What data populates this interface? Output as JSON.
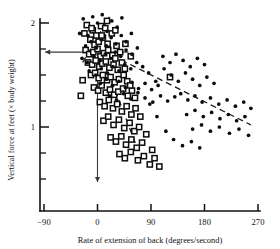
{
  "chart_data": {
    "type": "scatter",
    "title": "",
    "xlabel": "Rate of extension of back (degrees/second)",
    "ylabel": "Vertical force at feet (× body weight)",
    "xlim": [
      -90,
      270
    ],
    "ylim": [
      0.4,
      2.1
    ],
    "xticks": [
      -90,
      0,
      90,
      180,
      270
    ],
    "xtick_labels": [
      "−90",
      "0",
      "90",
      "180",
      "270"
    ],
    "yticks": [
      2,
      1
    ],
    "ytick_labels": [
      "2",
      "1"
    ],
    "yticks_minor": [
      1.75,
      1.5,
      1.25,
      0.75,
      0.5
    ],
    "grid": false,
    "legend": null,
    "annotations": [
      {
        "name": "horizontal-arrow-to-yaxis",
        "type": "arrow",
        "from": [
          52,
          1.72
        ],
        "to": [
          -88,
          1.72
        ],
        "note": "arrow pointing left to y-axis value"
      },
      {
        "name": "vertical-arrow-to-xaxis",
        "type": "arrow",
        "from": [
          0,
          1.62
        ],
        "to": [
          0,
          0.47
        ],
        "note": "arrow pointing down to x-axis at 0"
      }
    ],
    "trend_lines": [
      {
        "name": "upper-short-dashed",
        "style": "dashed",
        "from": [
          -25,
          1.62
        ],
        "to": [
          20,
          2.06
        ]
      },
      {
        "name": "long-shallow-dashed",
        "style": "dashed",
        "from": [
          10,
          1.73
        ],
        "to": [
          258,
          1.02
        ]
      },
      {
        "name": "steep-dashed",
        "style": "dashed",
        "from": [
          18,
          1.53
        ],
        "to": [
          68,
          0.78
        ]
      }
    ],
    "series": [
      {
        "name": "open-squares",
        "marker": "open-square",
        "color": "#0d0d0d",
        "points": [
          [
            -18,
            1.98
          ],
          [
            -8,
            1.93
          ],
          [
            -2,
            1.88
          ],
          [
            6,
            1.97
          ],
          [
            13,
            1.95
          ],
          [
            -12,
            1.84
          ],
          [
            -5,
            1.79
          ],
          [
            2,
            1.82
          ],
          [
            9,
            1.86
          ],
          [
            17,
            1.8
          ],
          [
            24,
            1.9
          ],
          [
            30,
            1.93
          ],
          [
            -20,
            1.74
          ],
          [
            -14,
            1.7
          ],
          [
            -7,
            1.72
          ],
          [
            0,
            1.75
          ],
          [
            5,
            1.68
          ],
          [
            11,
            1.71
          ],
          [
            18,
            1.74
          ],
          [
            25,
            1.69
          ],
          [
            32,
            1.78
          ],
          [
            38,
            1.72
          ],
          [
            -16,
            1.62
          ],
          [
            -9,
            1.6
          ],
          [
            -3,
            1.64
          ],
          [
            3,
            1.58
          ],
          [
            8,
            1.61
          ],
          [
            14,
            1.63
          ],
          [
            20,
            1.57
          ],
          [
            27,
            1.6
          ],
          [
            34,
            1.55
          ],
          [
            41,
            1.62
          ],
          [
            -11,
            1.5
          ],
          [
            -4,
            1.52
          ],
          [
            2,
            1.47
          ],
          [
            9,
            1.5
          ],
          [
            16,
            1.45
          ],
          [
            22,
            1.48
          ],
          [
            29,
            1.43
          ],
          [
            36,
            1.46
          ],
          [
            44,
            1.5
          ],
          [
            50,
            1.44
          ],
          [
            -6,
            1.38
          ],
          [
            1,
            1.35
          ],
          [
            7,
            1.4
          ],
          [
            14,
            1.33
          ],
          [
            21,
            1.36
          ],
          [
            28,
            1.31
          ],
          [
            35,
            1.34
          ],
          [
            43,
            1.37
          ],
          [
            51,
            1.3
          ],
          [
            58,
            1.35
          ],
          [
            4,
            1.24
          ],
          [
            12,
            1.2
          ],
          [
            19,
            1.26
          ],
          [
            26,
            1.18
          ],
          [
            33,
            1.22
          ],
          [
            41,
            1.15
          ],
          [
            49,
            1.2
          ],
          [
            57,
            1.12
          ],
          [
            64,
            1.18
          ],
          [
            10,
            1.06
          ],
          [
            18,
            1.1
          ],
          [
            27,
            1.02
          ],
          [
            36,
            1.07
          ],
          [
            45,
            0.99
          ],
          [
            54,
            1.04
          ],
          [
            62,
            0.96
          ],
          [
            70,
            1.0
          ],
          [
            22,
            0.9
          ],
          [
            31,
            0.86
          ],
          [
            40,
            0.91
          ],
          [
            48,
            0.83
          ],
          [
            57,
            0.88
          ],
          [
            66,
            0.8
          ],
          [
            75,
            0.85
          ],
          [
            37,
            0.74
          ],
          [
            46,
            0.7
          ],
          [
            56,
            0.76
          ],
          [
            68,
            0.68
          ],
          [
            78,
            0.72
          ],
          [
            88,
            0.64
          ],
          [
            96,
            0.7
          ],
          [
            30,
            1.66
          ],
          [
            46,
            1.56
          ],
          [
            55,
            1.4
          ],
          [
            63,
            1.28
          ],
          [
            72,
            1.1
          ],
          [
            82,
            0.93
          ],
          [
            92,
            0.78
          ],
          [
            104,
            0.62
          ],
          [
            -22,
            1.9
          ],
          [
            -25,
            1.45
          ],
          [
            -28,
            1.3
          ],
          [
            122,
            1.48
          ],
          [
            7,
            1.88
          ],
          [
            -10,
            1.95
          ],
          [
            47,
            1.8
          ],
          [
            56,
            1.68
          ],
          [
            16,
            2.02
          ]
        ]
      },
      {
        "name": "filled-dots",
        "marker": "filled-circle",
        "color": "#0d0d0d",
        "points": [
          [
            -30,
            1.9
          ],
          [
            -24,
            2.04
          ],
          [
            -16,
            1.88
          ],
          [
            -8,
            2.06
          ],
          [
            0,
            2.0
          ],
          [
            8,
            2.08
          ],
          [
            16,
            1.92
          ],
          [
            24,
            2.02
          ],
          [
            33,
            1.96
          ],
          [
            41,
            2.05
          ],
          [
            -20,
            1.78
          ],
          [
            -11,
            1.82
          ],
          [
            -2,
            1.76
          ],
          [
            7,
            1.84
          ],
          [
            15,
            1.78
          ],
          [
            23,
            1.86
          ],
          [
            31,
            1.8
          ],
          [
            40,
            1.88
          ],
          [
            48,
            1.82
          ],
          [
            57,
            1.9
          ],
          [
            -26,
            1.66
          ],
          [
            -17,
            1.62
          ],
          [
            -6,
            1.68
          ],
          [
            4,
            1.64
          ],
          [
            13,
            1.7
          ],
          [
            22,
            1.66
          ],
          [
            30,
            1.72
          ],
          [
            39,
            1.68
          ],
          [
            48,
            1.74
          ],
          [
            58,
            1.7
          ],
          [
            67,
            1.76
          ],
          [
            -14,
            1.54
          ],
          [
            -3,
            1.5
          ],
          [
            6,
            1.56
          ],
          [
            16,
            1.52
          ],
          [
            26,
            1.58
          ],
          [
            36,
            1.54
          ],
          [
            46,
            1.6
          ],
          [
            56,
            1.56
          ],
          [
            66,
            1.62
          ],
          [
            76,
            1.58
          ],
          [
            86,
            1.52
          ],
          [
            5,
            1.42
          ],
          [
            15,
            1.46
          ],
          [
            25,
            1.4
          ],
          [
            36,
            1.44
          ],
          [
            47,
            1.38
          ],
          [
            58,
            1.43
          ],
          [
            69,
            1.37
          ],
          [
            80,
            1.42
          ],
          [
            91,
            1.36
          ],
          [
            102,
            1.4
          ],
          [
            20,
            1.3
          ],
          [
            32,
            1.26
          ],
          [
            44,
            1.32
          ],
          [
            56,
            1.27
          ],
          [
            68,
            1.33
          ],
          [
            80,
            1.28
          ],
          [
            93,
            1.24
          ],
          [
            106,
            1.3
          ],
          [
            118,
            1.25
          ],
          [
            130,
            1.29
          ],
          [
            112,
            1.56
          ],
          [
            124,
            1.5
          ],
          [
            136,
            1.44
          ],
          [
            148,
            1.52
          ],
          [
            160,
            1.46
          ],
          [
            172,
            1.4
          ],
          [
            184,
            1.48
          ],
          [
            196,
            1.42
          ],
          [
            140,
            1.32
          ],
          [
            152,
            1.26
          ],
          [
            164,
            1.3
          ],
          [
            176,
            1.24
          ],
          [
            190,
            1.28
          ],
          [
            204,
            1.22
          ],
          [
            218,
            1.26
          ],
          [
            232,
            1.2
          ],
          [
            246,
            1.24
          ],
          [
            258,
            1.18
          ],
          [
            150,
            1.12
          ],
          [
            164,
            1.16
          ],
          [
            178,
            1.1
          ],
          [
            192,
            1.14
          ],
          [
            206,
            1.08
          ],
          [
            220,
            1.12
          ],
          [
            234,
            1.06
          ],
          [
            248,
            1.1
          ],
          [
            160,
            0.98
          ],
          [
            175,
            1.02
          ],
          [
            190,
            0.96
          ],
          [
            205,
            1.0
          ],
          [
            222,
            0.94
          ],
          [
            238,
            0.98
          ],
          [
            254,
            0.92
          ],
          [
            110,
            1.68
          ],
          [
            122,
            1.62
          ],
          [
            132,
            1.7
          ],
          [
            144,
            1.64
          ],
          [
            156,
            1.58
          ],
          [
            168,
            1.66
          ],
          [
            180,
            1.6
          ],
          [
            98,
            1.44
          ],
          [
            88,
            1.22
          ],
          [
            100,
            1.1
          ],
          [
            115,
            0.96
          ],
          [
            128,
            0.88
          ],
          [
            143,
            0.82
          ],
          [
            158,
            0.86
          ],
          [
            172,
            0.8
          ]
        ]
      }
    ]
  }
}
